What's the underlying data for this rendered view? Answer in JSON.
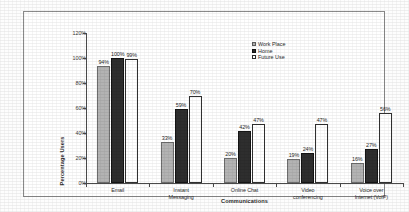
{
  "chart_data": {
    "type": "bar",
    "title": "",
    "subtitle": "",
    "xlabel": "Communications",
    "ylabel": "Percentage Users",
    "ylim": [
      0,
      120
    ],
    "ytick_labels": [
      "0%",
      "20%",
      "40%",
      "60%",
      "80%",
      "100%",
      "120%"
    ],
    "ytick_values": [
      0,
      20,
      40,
      60,
      80,
      100,
      120
    ],
    "grid": false,
    "legend_position": "top-right",
    "categories": [
      "Email",
      "Instant Messaging",
      "Online Chat",
      "Video conferencing",
      "Voice over Internet (VoIP)"
    ],
    "category_lines": [
      [
        "Email"
      ],
      [
        "Instant",
        "Messaging"
      ],
      [
        "Online Chat"
      ],
      [
        "Video",
        "conferencing"
      ],
      [
        "Voice over",
        "Internet (VoIP)"
      ]
    ],
    "series": [
      {
        "name": "Work Place",
        "color": "#b3b3b3",
        "values": [
          94,
          33,
          20,
          19,
          16
        ],
        "labels": [
          "94%",
          "33%",
          "20%",
          "19%",
          "16%"
        ]
      },
      {
        "name": "Home",
        "color": "#2e2e2e",
        "values": [
          100,
          59,
          42,
          24,
          27
        ],
        "labels": [
          "100%",
          "59%",
          "42%",
          "24%",
          "27%"
        ]
      },
      {
        "name": "Future Use",
        "color": "#ffffff",
        "values": [
          99,
          70,
          47,
          47,
          56
        ],
        "labels": [
          "99%",
          "70%",
          "47%",
          "47%",
          "56%"
        ]
      }
    ]
  },
  "colors": {
    "axis": "#4a4a4a",
    "frame_border": "#8a8a8a",
    "text": "#2b2b2b",
    "series_work_place": "#b3b3b3",
    "series_home": "#2e2e2e",
    "series_future_use": "#ffffff"
  }
}
